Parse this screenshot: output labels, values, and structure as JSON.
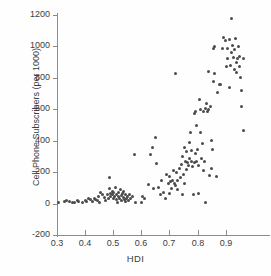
{
  "chart_data": {
    "type": "scatter",
    "title": "",
    "xlabel": "HDI",
    "ylabel": "Cell Phone Subscribers (per 1000)",
    "xlim": [
      0.3,
      1.04
    ],
    "ylim": [
      -200,
      1200
    ],
    "xticks": [
      0.3,
      0.4,
      0.5,
      0.6,
      0.7,
      0.8,
      0.9
    ],
    "xticklabels": [
      "0.3",
      "0.4",
      "0.5",
      "0.6",
      "0.7",
      "0.8",
      "0.9"
    ],
    "yticks": [
      -200,
      0,
      200,
      400,
      600,
      800,
      1000,
      1200
    ],
    "yticklabels": [
      "-200",
      "0",
      "200",
      "400",
      "600",
      "800",
      "1000",
      "1200"
    ],
    "grid": false,
    "legend": null,
    "marker_color": "#4b4b4b",
    "marker_size": 3,
    "axis_color": "#8b8b8b",
    "text_color": "#3c3c3c",
    "background": "#fefefe",
    "points": [
      [
        0.305,
        10
      ],
      [
        0.325,
        12
      ],
      [
        0.335,
        20
      ],
      [
        0.345,
        15
      ],
      [
        0.355,
        8
      ],
      [
        0.362,
        5
      ],
      [
        0.372,
        18
      ],
      [
        0.378,
        14
      ],
      [
        0.392,
        10
      ],
      [
        0.4,
        22
      ],
      [
        0.405,
        16
      ],
      [
        0.412,
        30
      ],
      [
        0.418,
        25
      ],
      [
        0.425,
        12
      ],
      [
        0.432,
        35
      ],
      [
        0.438,
        28
      ],
      [
        0.445,
        20
      ],
      [
        0.448,
        45
      ],
      [
        0.452,
        10
      ],
      [
        0.455,
        72
      ],
      [
        0.462,
        60
      ],
      [
        0.468,
        40
      ],
      [
        0.472,
        18
      ],
      [
        0.478,
        55
      ],
      [
        0.482,
        30
      ],
      [
        0.485,
        165
      ],
      [
        0.488,
        95
      ],
      [
        0.49,
        62
      ],
      [
        0.492,
        48
      ],
      [
        0.496,
        80
      ],
      [
        0.498,
        55
      ],
      [
        0.5,
        30
      ],
      [
        0.502,
        70
      ],
      [
        0.505,
        42
      ],
      [
        0.508,
        100
      ],
      [
        0.51,
        58
      ],
      [
        0.512,
        25
      ],
      [
        0.515,
        10
      ],
      [
        0.518,
        45
      ],
      [
        0.52,
        68
      ],
      [
        0.522,
        30
      ],
      [
        0.525,
        88
      ],
      [
        0.528,
        52
      ],
      [
        0.53,
        18
      ],
      [
        0.532,
        62
      ],
      [
        0.535,
        40
      ],
      [
        0.538,
        75
      ],
      [
        0.54,
        28
      ],
      [
        0.542,
        12
      ],
      [
        0.545,
        55
      ],
      [
        0.548,
        35
      ],
      [
        0.552,
        45
      ],
      [
        0.555,
        22
      ],
      [
        0.558,
        58
      ],
      [
        0.562,
        30
      ],
      [
        0.568,
        42
      ],
      [
        0.575,
        315
      ],
      [
        0.578,
        5
      ],
      [
        0.6,
        5
      ],
      [
        0.605,
        48
      ],
      [
        0.612,
        35
      ],
      [
        0.625,
        120
      ],
      [
        0.632,
        310
      ],
      [
        0.638,
        355
      ],
      [
        0.645,
        95
      ],
      [
        0.65,
        420
      ],
      [
        0.655,
        255
      ],
      [
        0.66,
        100
      ],
      [
        0.668,
        60
      ],
      [
        0.672,
        150
      ],
      [
        0.678,
        70
      ],
      [
        0.685,
        30
      ],
      [
        0.69,
        185
      ],
      [
        0.695,
        130
      ],
      [
        0.7,
        170
      ],
      [
        0.702,
        62
      ],
      [
        0.705,
        140
      ],
      [
        0.708,
        95
      ],
      [
        0.712,
        150
      ],
      [
        0.715,
        210
      ],
      [
        0.718,
        130
      ],
      [
        0.72,
        830
      ],
      [
        0.722,
        118
      ],
      [
        0.725,
        200
      ],
      [
        0.728,
        145
      ],
      [
        0.73,
        90
      ],
      [
        0.735,
        225
      ],
      [
        0.738,
        165
      ],
      [
        0.742,
        250
      ],
      [
        0.745,
        60
      ],
      [
        0.748,
        300
      ],
      [
        0.75,
        185
      ],
      [
        0.752,
        125
      ],
      [
        0.755,
        355
      ],
      [
        0.758,
        265
      ],
      [
        0.76,
        215
      ],
      [
        0.762,
        330
      ],
      [
        0.765,
        260
      ],
      [
        0.768,
        240
      ],
      [
        0.77,
        390
      ],
      [
        0.772,
        285
      ],
      [
        0.775,
        455
      ],
      [
        0.778,
        265
      ],
      [
        0.78,
        340
      ],
      [
        0.782,
        235
      ],
      [
        0.785,
        58
      ],
      [
        0.788,
        575
      ],
      [
        0.79,
        262
      ],
      [
        0.792,
        585
      ],
      [
        0.794,
        318
      ],
      [
        0.796,
        268
      ],
      [
        0.798,
        500
      ],
      [
        0.8,
        345
      ],
      [
        0.802,
        240
      ],
      [
        0.805,
        62
      ],
      [
        0.808,
        665
      ],
      [
        0.81,
        600
      ],
      [
        0.812,
        455
      ],
      [
        0.815,
        290
      ],
      [
        0.818,
        385
      ],
      [
        0.82,
        585
      ],
      [
        0.822,
        210
      ],
      [
        0.825,
        268
      ],
      [
        0.828,
        5
      ],
      [
        0.83,
        605
      ],
      [
        0.832,
        640
      ],
      [
        0.835,
        585
      ],
      [
        0.838,
        840
      ],
      [
        0.84,
        600
      ],
      [
        0.842,
        180
      ],
      [
        0.845,
        620
      ],
      [
        0.848,
        400
      ],
      [
        0.85,
        222
      ],
      [
        0.852,
        345
      ],
      [
        0.855,
        985
      ],
      [
        0.858,
        775
      ],
      [
        0.86,
        830
      ],
      [
        0.862,
        1000
      ],
      [
        0.868,
        172
      ],
      [
        0.872,
        705
      ],
      [
        0.878,
        760
      ],
      [
        0.882,
        760
      ],
      [
        0.888,
        985
      ],
      [
        0.892,
        1060
      ],
      [
        0.898,
        1035
      ],
      [
        0.902,
        870
      ],
      [
        0.905,
        925
      ],
      [
        0.908,
        985
      ],
      [
        0.912,
        740
      ],
      [
        0.915,
        1045
      ],
      [
        0.918,
        880
      ],
      [
        0.92,
        960
      ],
      [
        0.922,
        1180
      ],
      [
        0.925,
        1005
      ],
      [
        0.928,
        930
      ],
      [
        0.93,
        855
      ],
      [
        0.932,
        980
      ],
      [
        0.935,
        1050
      ],
      [
        0.938,
        900
      ],
      [
        0.94,
        835
      ],
      [
        0.942,
        925
      ],
      [
        0.945,
        1000
      ],
      [
        0.948,
        870
      ],
      [
        0.95,
        935
      ],
      [
        0.952,
        805
      ],
      [
        0.955,
        615
      ],
      [
        0.958,
        720
      ],
      [
        0.962,
        465
      ],
      [
        0.965,
        925
      ]
    ]
  }
}
